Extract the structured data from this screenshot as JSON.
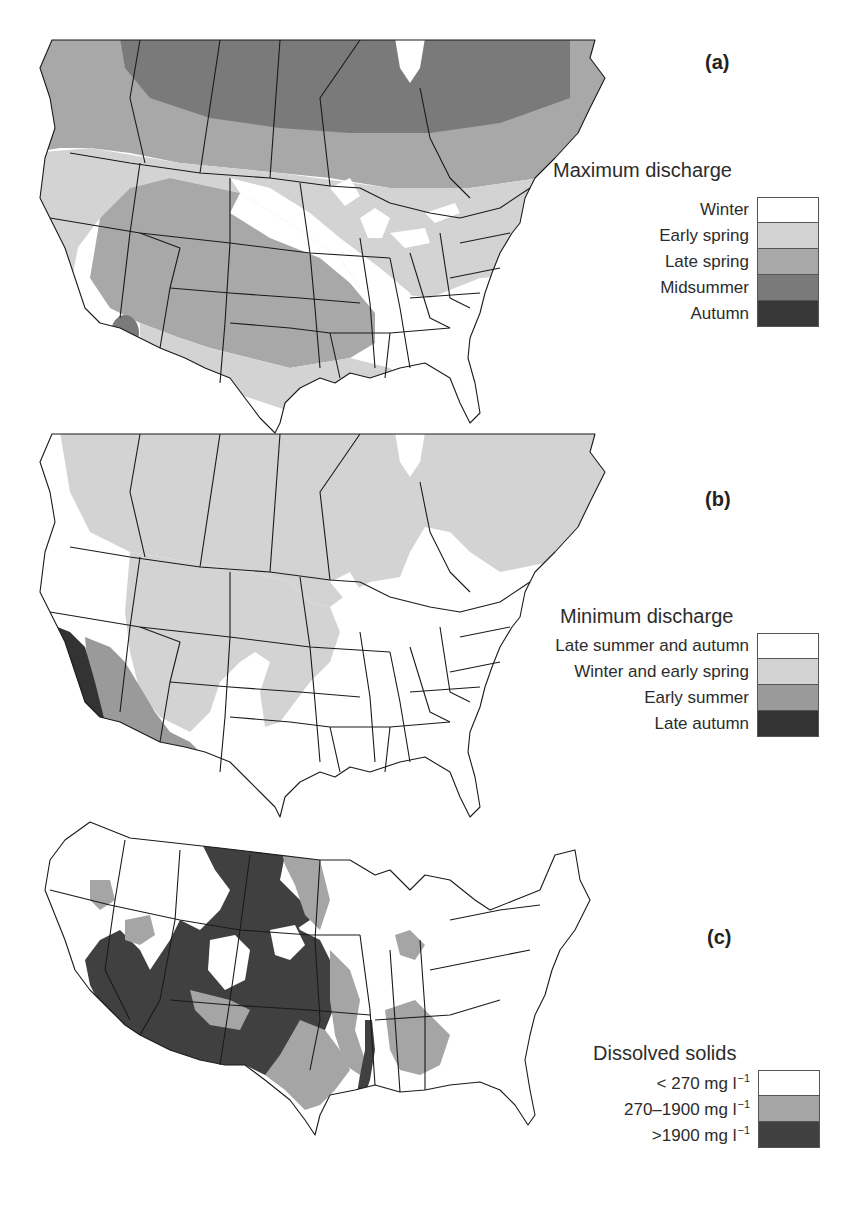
{
  "panels": [
    {
      "id": "a",
      "label": "(a)",
      "legend_title": "Maximum discharge",
      "legend": [
        {
          "label": "Winter",
          "color": "#ffffff"
        },
        {
          "label": "Early spring",
          "color": "#d3d3d3"
        },
        {
          "label": "Late spring",
          "color": "#a8a8a8"
        },
        {
          "label": "Midsummer",
          "color": "#7a7a7a"
        },
        {
          "label": "Autumn",
          "color": "#383838"
        }
      ]
    },
    {
      "id": "b",
      "label": "(b)",
      "legend_title": "Minimum discharge",
      "legend": [
        {
          "label": "Late summer and autumn",
          "color": "#ffffff"
        },
        {
          "label": "Winter and early spring",
          "color": "#d3d3d3"
        },
        {
          "label": "Early summer",
          "color": "#9a9a9a"
        },
        {
          "label": "Late autumn",
          "color": "#333333"
        }
      ]
    },
    {
      "id": "c",
      "label": "(c)",
      "legend_title": "Dissolved solids",
      "legend": [
        {
          "label": "< 270 mg l",
          "unit_exp": "−1",
          "color": "#ffffff"
        },
        {
          "label": "270–1900 mg l",
          "unit_exp": "−1",
          "color": "#a5a5a5"
        },
        {
          "label": ">1900 mg l",
          "unit_exp": "−1",
          "color": "#404040"
        }
      ]
    }
  ],
  "colors": {
    "border": "#1a1a1a",
    "background": "#ffffff"
  }
}
